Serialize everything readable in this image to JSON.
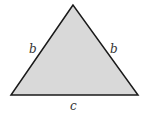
{
  "diagram": {
    "type": "isosceles-triangle",
    "fill_color": "#d9d9d9",
    "stroke_color": "#1a1a1a",
    "vertices": {
      "apex": [
        73,
        5
      ],
      "base_left": [
        11,
        95
      ],
      "base_right": [
        138,
        95
      ]
    },
    "labels": {
      "left_side": "b",
      "right_side": "b",
      "base": "c"
    }
  }
}
